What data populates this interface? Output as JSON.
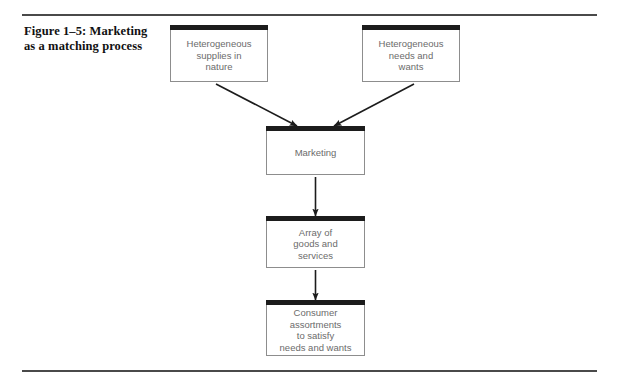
{
  "figure": {
    "caption_lines": [
      "Figure 1–5: Marketing",
      "as a matching process"
    ],
    "caption_text": "Figure 1–5: Marketing as a matching process"
  },
  "diagram": {
    "type": "flowchart",
    "nodes": [
      {
        "id": "supplies",
        "lines": [
          "Heterogeneous",
          "supplies in",
          "nature"
        ],
        "text": "Heterogeneous supplies in nature"
      },
      {
        "id": "needs",
        "lines": [
          "Heterogeneous",
          "needs and",
          "wants"
        ],
        "text": "Heterogeneous needs and wants"
      },
      {
        "id": "marketing",
        "lines": [
          "Marketing"
        ],
        "text": "Marketing"
      },
      {
        "id": "array",
        "lines": [
          "Array of",
          "goods and",
          "services"
        ],
        "text": "Array of goods and services"
      },
      {
        "id": "consumer",
        "lines": [
          "Consumer",
          "assortments",
          "to satisfy",
          "needs and wants"
        ],
        "text": "Consumer assortments to satisfy needs and wants"
      }
    ],
    "edges": [
      {
        "from": "supplies",
        "to": "marketing",
        "style": "diagonal-arrow"
      },
      {
        "from": "needs",
        "to": "marketing",
        "style": "diagonal-arrow"
      },
      {
        "from": "marketing",
        "to": "array",
        "style": "vertical-arrow"
      },
      {
        "from": "array",
        "to": "consumer",
        "style": "vertical-arrow"
      }
    ]
  },
  "colors": {
    "rule": "#4a4a4a",
    "node_border": "#8d8d8d",
    "node_band": "#1c1c1c",
    "node_text": "#6b6b6b",
    "caption_text": "#111111",
    "arrow": "#1c1c1c",
    "background": "#ffffff"
  }
}
